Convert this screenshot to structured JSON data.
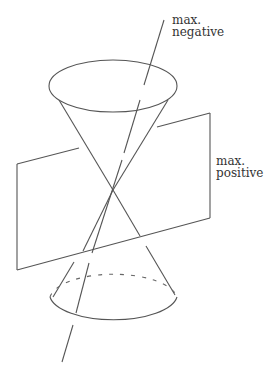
{
  "diagram": {
    "type": "double-cone-with-plane",
    "colors": {
      "line": "#555555",
      "text": "#333333",
      "background": "#ffffff"
    },
    "labels": {
      "axis_top": {
        "line1": "max.",
        "line2": "negative"
      },
      "plane_right": {
        "line1": "max.",
        "line2": "positive"
      }
    }
  }
}
